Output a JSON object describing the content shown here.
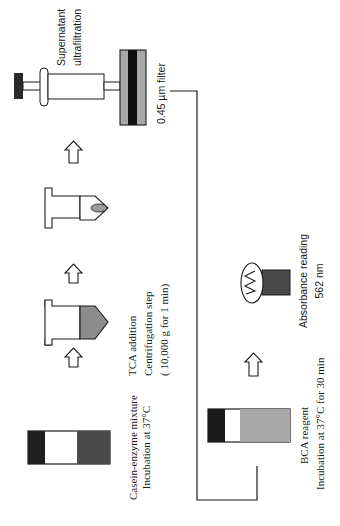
{
  "diagram": {
    "colors": {
      "ink": "#1a1a1a",
      "dark_fill": "#2a2a2a",
      "mid_fill": "#555555",
      "light_fill": "#a8a8a8",
      "pellet_fill": "#9a9a9a",
      "background": "#ffffff"
    },
    "steps": [
      {
        "id": "casein",
        "icon": "tube-three-band-icon",
        "lines": [
          "Casein-enzyme mixture",
          "Incubation at 37°C"
        ]
      },
      {
        "id": "tca",
        "icon": "centrifuge-tube-icon",
        "lines": [
          "TCA addition",
          "Centrifugation step",
          "( 10,000 g for 1 min)"
        ]
      },
      {
        "id": "pellet",
        "icon": "centrifuge-tube-pellet-icon",
        "lines": []
      },
      {
        "id": "ultrafiltration",
        "icon": "syringe-icon",
        "lines": [
          "Supernatant",
          "ultrafiltration"
        ]
      },
      {
        "id": "filter",
        "icon": "filter-icon",
        "lines": [
          "0.45 µm filter"
        ]
      },
      {
        "id": "bca",
        "icon": "tube-three-band-icon",
        "lines": [
          "BCA reagent",
          "Incubation at 37°C for 30 min"
        ]
      },
      {
        "id": "absorbance",
        "icon": "lamp-cuvette-icon",
        "lines": [
          "Absorbance reading",
          "562 nm"
        ]
      }
    ],
    "arrows": [
      "arrow-up-icon",
      "arrow-up-icon",
      "arrow-up-icon",
      "arrow-up-icon"
    ]
  }
}
